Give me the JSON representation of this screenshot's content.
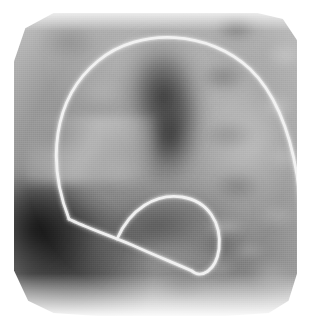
{
  "image": {
    "kind": "radiograph",
    "modality_label": "fluoroscopic-radiograph",
    "width": 310,
    "height": 334,
    "background_color": "#ffffff",
    "colorspace": "grayscale",
    "has_text_annotations": false,
    "visible_text": ""
  },
  "film": {
    "name": "radiographic-field",
    "left": 14,
    "top": 13,
    "width": 283,
    "height": 303,
    "corner_style": "chamfered",
    "mean_tone": "#8e8e8e",
    "darkest_tone": "#0d0d0d",
    "brightest_tone": "#f2f2f2"
  },
  "anatomy": [
    {
      "name": "mediastinal-shadow",
      "label": "Dark mediastinal / cardiac silhouette",
      "region": "upper-center",
      "tone": "dark",
      "color": "#1e1e1e"
    },
    {
      "name": "rib-parenchyma-texture",
      "label": "Mottled rib and lung parenchyma texture",
      "region": "right",
      "tone": "mixed",
      "color": "#b4b4b4"
    },
    {
      "name": "dense-soft-tissue",
      "label": "Dense soft-tissue / diaphragm shadow",
      "region": "lower-left",
      "tone": "very-dark",
      "color": "#0d0d0d"
    },
    {
      "name": "lucent-field",
      "label": "Lucent air-filled field",
      "region": "upper-right",
      "tone": "bright",
      "color": "#e6e6e6"
    },
    {
      "name": "lower-rib-margins",
      "label": "Bright lower rib margins",
      "region": "lower-right",
      "tone": "bright",
      "color": "#f0f0f0"
    }
  ],
  "catheter": {
    "name": "catheter",
    "label": "Radio-opaque catheter",
    "color": "#f5f5f5",
    "stroke_width": 3.0,
    "description": "Catheter enters at upper-left, arcs over the top of the field, descends along the right margin, and a second limb crosses diagonally to a distal pigtail loop near the centre-bottom.",
    "segments": [
      {
        "name": "catheter-proximal-arc",
        "label": "Proximal arc over superior field",
        "path": "M 55,206 C 33,150 38,86 84,48 C 126,13 196,18 236,56 C 262,81 276,120 283,162 C 288,198 290,245 290,282"
      },
      {
        "name": "catheter-diagonal-limb",
        "label": "Diagonal descending limb",
        "path": "M 55,206 C 70,214 95,222 118,232 C 140,242 160,250 178,258"
      },
      {
        "name": "catheter-distal-loop",
        "label": "Distal pigtail loop",
        "path": "M 103,226 C 116,196 142,180 168,184 C 194,188 208,210 205,236 C 202,258 187,266 178,258"
      }
    ]
  }
}
